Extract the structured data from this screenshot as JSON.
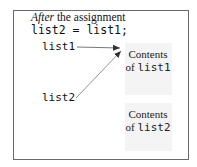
{
  "caption": {
    "italic": "After",
    "rest": " the assignment"
  },
  "code": "list2 = list1;",
  "references": [
    {
      "label": "list1",
      "points_to": "Contents of list1"
    },
    {
      "label": "list2",
      "points_to": "Contents of list1"
    }
  ],
  "boxes": [
    {
      "line1": "Contents",
      "prefix": "of ",
      "var": "list1"
    },
    {
      "line1": "Contents",
      "prefix": "of ",
      "var": "list2"
    }
  ],
  "colors": {
    "frame": "#6a6a6a",
    "box_fill": "#f4f4f4",
    "arrow": "#555555"
  }
}
